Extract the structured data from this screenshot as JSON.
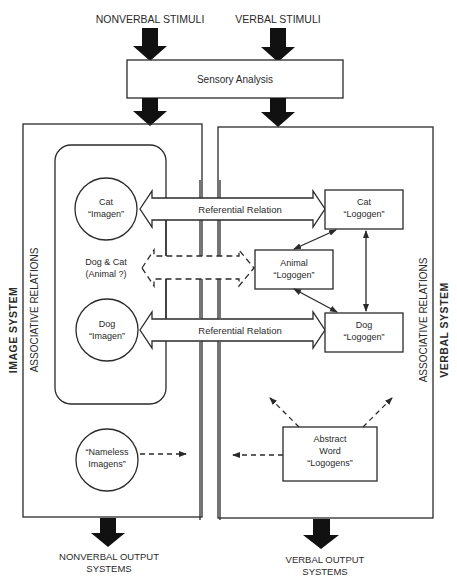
{
  "diagram": {
    "inputs": {
      "nonverbal": "NONVERBAL STIMULI",
      "verbal": "VERBAL STIMULI"
    },
    "sensory_analysis": "Sensory Analysis",
    "image_system": {
      "label": "IMAGE SYSTEM",
      "associative_label": "ASSOCIATIVE RELATIONS",
      "nodes": [
        {
          "line1": "Cat",
          "line2": "“Imagen”"
        },
        {
          "line1": "Dog & Cat",
          "line2": "(Animal ?)"
        },
        {
          "line1": "Dog",
          "line2": "“Imagen”"
        },
        {
          "line1": "“Nameless",
          "line2": "Imagens”"
        }
      ]
    },
    "verbal_system": {
      "label": "VERBAL SYSTEM",
      "associative_label": "ASSOCIATIVE RELATIONS",
      "nodes": [
        {
          "line1": "Cat",
          "line2": "“Logogen”"
        },
        {
          "line1": "Animal",
          "line2": "“Logogen”"
        },
        {
          "line1": "Dog",
          "line2": "“Logogen”"
        },
        {
          "line1": "Abstract",
          "line2": "Word",
          "line3": "“Logogens”"
        }
      ]
    },
    "relations": {
      "referential_1": "Referential Relation",
      "referential_2": "Referential Relation"
    },
    "outputs": {
      "nonverbal_line1": "NONVERBAL OUTPUT",
      "nonverbal_line2": "SYSTEMS",
      "verbal_line1": "VERBAL OUTPUT",
      "verbal_line2": "SYSTEMS"
    }
  }
}
